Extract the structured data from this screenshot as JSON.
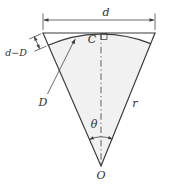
{
  "diagram": {
    "labels": {
      "chord": "d",
      "chord_minus_arc": "d−D",
      "arc": "D",
      "top_center": "C",
      "radius": "r",
      "angle": "θ",
      "apex": "O"
    },
    "colors": {
      "line": "#3a3a3a",
      "fill": "#f0f1f0",
      "background": "#ffffff"
    }
  }
}
